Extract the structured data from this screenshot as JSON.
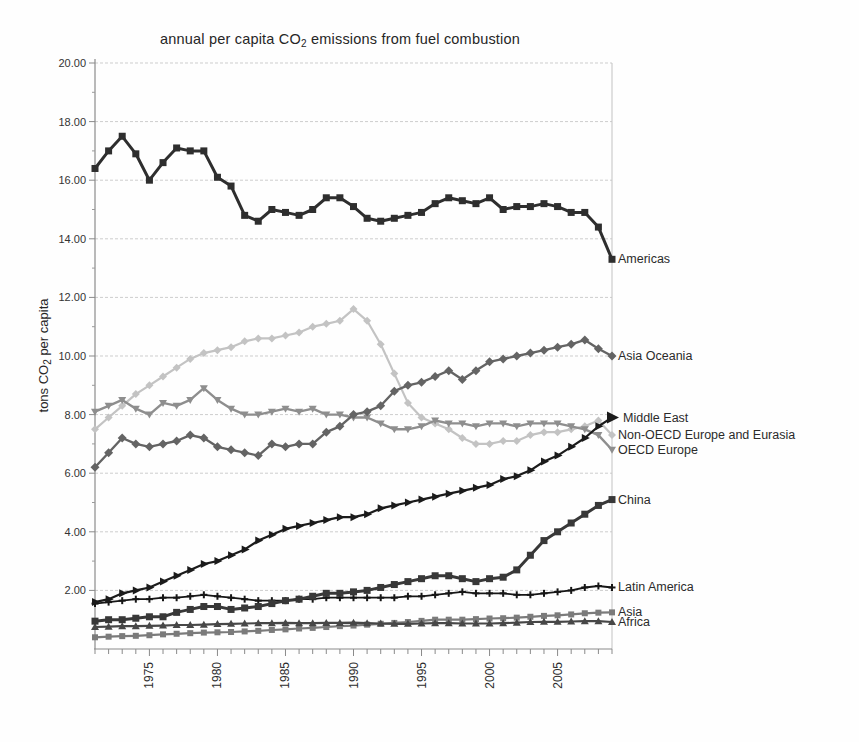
{
  "title": {
    "pre": "annual per capita CO",
    "sub": "2",
    "post": " emissions from fuel combustion"
  },
  "y_axis": {
    "title_pre": "tons CO",
    "title_sub": "2",
    "title_post": " per capita",
    "tick_labels": [
      "20.00",
      "18.00",
      "16.00",
      "14.00",
      "12.00",
      "10.00",
      "8.00",
      "6.00",
      "4.00",
      "2.00"
    ],
    "tick_values": [
      20,
      18,
      16,
      14,
      12,
      10,
      8,
      6,
      4,
      2
    ]
  },
  "x_axis": {
    "tick_labels": [
      "1975",
      "1980",
      "1985",
      "1990",
      "1995",
      "2000",
      "2005"
    ],
    "tick_values": [
      1975,
      1980,
      1985,
      1990,
      1995,
      2000,
      2005
    ]
  },
  "chart_data": {
    "type": "line",
    "title": "annual per capita CO2 emissions from fuel combustion",
    "xlabel": "year",
    "ylabel": "tons CO2 per capita",
    "x_range": [
      1971,
      2009
    ],
    "ylim": [
      0,
      20
    ],
    "grid": "horizontal, dashed, every 2.00",
    "legend_position": "labels at right end of each line",
    "x": [
      1971,
      1972,
      1973,
      1974,
      1975,
      1976,
      1977,
      1978,
      1979,
      1980,
      1981,
      1982,
      1983,
      1984,
      1985,
      1986,
      1987,
      1988,
      1989,
      1990,
      1991,
      1992,
      1993,
      1994,
      1995,
      1996,
      1997,
      1998,
      1999,
      2000,
      2001,
      2002,
      2003,
      2004,
      2005,
      2006,
      2007,
      2008,
      2009
    ],
    "series": [
      {
        "name": "Americas",
        "color": "#2e2e2e",
        "marker": "square",
        "marker_size": 7,
        "line_width": 3,
        "values": [
          16.4,
          17.0,
          17.5,
          16.9,
          16.0,
          16.6,
          17.1,
          17.0,
          17.0,
          16.1,
          15.8,
          14.8,
          14.6,
          15.0,
          14.9,
          14.8,
          15.0,
          15.4,
          15.4,
          15.1,
          14.7,
          14.6,
          14.7,
          14.8,
          14.9,
          15.2,
          15.4,
          15.3,
          15.2,
          15.4,
          15.0,
          15.1,
          15.1,
          15.2,
          15.1,
          14.9,
          14.9,
          14.4,
          13.3
        ]
      },
      {
        "name": "Asia Oceania",
        "color": "#646464",
        "marker": "diamond",
        "marker_size": 7,
        "line_width": 2.4,
        "values": [
          6.2,
          6.7,
          7.2,
          7.0,
          6.9,
          7.0,
          7.1,
          7.3,
          7.2,
          6.9,
          6.8,
          6.7,
          6.6,
          7.0,
          6.9,
          7.0,
          7.0,
          7.4,
          7.6,
          8.0,
          8.1,
          8.3,
          8.8,
          9.0,
          9.1,
          9.3,
          9.5,
          9.2,
          9.5,
          9.8,
          9.9,
          10.0,
          10.1,
          10.2,
          10.3,
          10.4,
          10.55,
          10.25,
          10.0
        ]
      },
      {
        "name": "Middle East",
        "color": "#1b1b1b",
        "marker": "triangle-right",
        "marker_size": 6,
        "line_width": 2.2,
        "values": [
          1.6,
          1.7,
          1.9,
          2.0,
          2.1,
          2.3,
          2.5,
          2.7,
          2.9,
          3.0,
          3.2,
          3.4,
          3.7,
          3.9,
          4.1,
          4.2,
          4.3,
          4.4,
          4.5,
          4.5,
          4.6,
          4.8,
          4.9,
          5.0,
          5.1,
          5.2,
          5.3,
          5.4,
          5.5,
          5.6,
          5.8,
          5.9,
          6.1,
          6.4,
          6.6,
          6.9,
          7.2,
          7.6,
          7.9
        ]
      },
      {
        "name": "Non-OECD Europe and Eurasia",
        "color": "#c3c3c3",
        "marker": "diamond",
        "marker_size": 6,
        "line_width": 2.2,
        "values": [
          7.5,
          7.9,
          8.3,
          8.7,
          9.0,
          9.3,
          9.6,
          9.9,
          10.1,
          10.2,
          10.3,
          10.5,
          10.6,
          10.6,
          10.7,
          10.8,
          11.0,
          11.1,
          11.2,
          11.6,
          11.2,
          10.4,
          9.4,
          8.4,
          7.9,
          7.7,
          7.5,
          7.2,
          7.0,
          7.0,
          7.1,
          7.1,
          7.3,
          7.4,
          7.4,
          7.5,
          7.6,
          7.8,
          7.3
        ]
      },
      {
        "name": "OECD Europe",
        "color": "#8e8e8e",
        "marker": "triangle-down",
        "marker_size": 6,
        "line_width": 2.4,
        "values": [
          8.1,
          8.3,
          8.5,
          8.2,
          8.0,
          8.4,
          8.3,
          8.5,
          8.9,
          8.5,
          8.2,
          8.0,
          8.0,
          8.1,
          8.2,
          8.1,
          8.2,
          8.0,
          8.0,
          7.9,
          7.9,
          7.7,
          7.5,
          7.5,
          7.6,
          7.8,
          7.7,
          7.7,
          7.6,
          7.7,
          7.7,
          7.6,
          7.7,
          7.7,
          7.7,
          7.6,
          7.5,
          7.3,
          6.8
        ]
      },
      {
        "name": "China",
        "color": "#383838",
        "marker": "square",
        "marker_size": 7,
        "line_width": 3,
        "values": [
          0.95,
          1.0,
          1.0,
          1.05,
          1.1,
          1.1,
          1.25,
          1.35,
          1.45,
          1.45,
          1.35,
          1.4,
          1.45,
          1.55,
          1.65,
          1.7,
          1.8,
          1.9,
          1.9,
          1.95,
          2.0,
          2.1,
          2.2,
          2.3,
          2.4,
          2.5,
          2.5,
          2.4,
          2.3,
          2.4,
          2.45,
          2.7,
          3.2,
          3.7,
          4.0,
          4.3,
          4.6,
          4.9,
          5.1
        ]
      },
      {
        "name": "Latin America",
        "color": "#161616",
        "marker": "plus",
        "marker_size": 7,
        "line_width": 1.8,
        "values": [
          1.55,
          1.6,
          1.65,
          1.7,
          1.7,
          1.75,
          1.75,
          1.8,
          1.85,
          1.8,
          1.75,
          1.7,
          1.65,
          1.65,
          1.65,
          1.7,
          1.7,
          1.75,
          1.75,
          1.75,
          1.75,
          1.75,
          1.75,
          1.8,
          1.8,
          1.85,
          1.9,
          1.95,
          1.9,
          1.9,
          1.9,
          1.85,
          1.85,
          1.9,
          1.95,
          2.0,
          2.1,
          2.15,
          2.1
        ]
      },
      {
        "name": "Asia",
        "color": "#7b7b7b",
        "marker": "square",
        "marker_size": 6,
        "line_width": 2.2,
        "values": [
          0.4,
          0.42,
          0.44,
          0.45,
          0.47,
          0.5,
          0.52,
          0.54,
          0.56,
          0.57,
          0.58,
          0.6,
          0.62,
          0.65,
          0.67,
          0.7,
          0.72,
          0.75,
          0.78,
          0.8,
          0.83,
          0.86,
          0.89,
          0.92,
          0.96,
          1.0,
          1.0,
          1.0,
          1.02,
          1.04,
          1.05,
          1.07,
          1.1,
          1.13,
          1.15,
          1.18,
          1.22,
          1.24,
          1.25
        ]
      },
      {
        "name": "Africa",
        "color": "#474747",
        "marker": "triangle-up",
        "marker_size": 6,
        "line_width": 2.2,
        "values": [
          0.75,
          0.76,
          0.78,
          0.78,
          0.79,
          0.8,
          0.82,
          0.82,
          0.83,
          0.85,
          0.86,
          0.87,
          0.88,
          0.88,
          0.89,
          0.88,
          0.88,
          0.89,
          0.89,
          0.9,
          0.88,
          0.87,
          0.86,
          0.86,
          0.87,
          0.88,
          0.88,
          0.87,
          0.87,
          0.87,
          0.88,
          0.9,
          0.92,
          0.93,
          0.93,
          0.94,
          0.95,
          0.95,
          0.92
        ]
      }
    ]
  }
}
